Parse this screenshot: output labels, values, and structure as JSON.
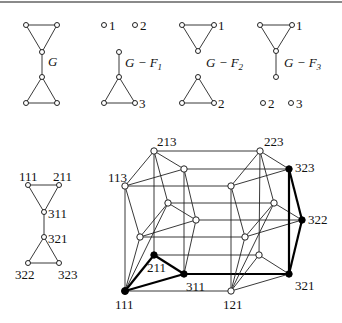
{
  "figure": {
    "top_panels": [
      {
        "id": "G",
        "label": "G",
        "vertex_labels": []
      },
      {
        "id": "G-F1",
        "label": "G − F",
        "subscript": "1",
        "vertex_labels": [
          "1",
          "2",
          "3"
        ]
      },
      {
        "id": "G-F2",
        "label": "G − F",
        "subscript": "2",
        "vertex_labels": [
          "1",
          "2"
        ]
      },
      {
        "id": "G-F3",
        "label": "G − F",
        "subscript": "3",
        "vertex_labels": [
          "1",
          "2",
          "3"
        ]
      }
    ],
    "small_graph": {
      "vertex_labels": [
        "111",
        "211",
        "311",
        "321",
        "322",
        "323"
      ]
    },
    "product_graph": {
      "vertex_labels": [
        "213",
        "113",
        "211",
        "311",
        "111",
        "223",
        "323",
        "322",
        "321",
        "121"
      ],
      "highlighted_vertices": [
        "111",
        "211",
        "311",
        "321",
        "322",
        "323"
      ],
      "highlight_color": "#000000"
    }
  }
}
